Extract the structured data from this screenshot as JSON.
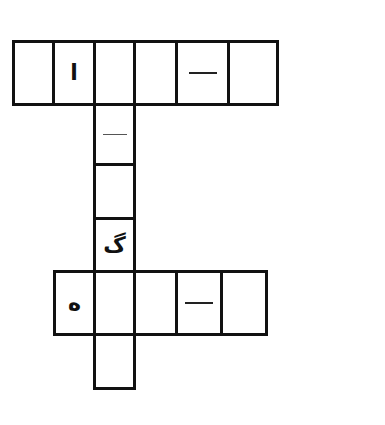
{
  "puzzle": {
    "type": "crossword-grid",
    "top_row": {
      "cells": [
        {
          "content": ""
        },
        {
          "content": "ا"
        },
        {
          "content": ""
        },
        {
          "content": ""
        },
        {
          "content": "—",
          "kind": "dash"
        },
        {
          "content": ""
        }
      ]
    },
    "vertical_column": {
      "cells": [
        {
          "content": "—",
          "kind": "dash"
        },
        {
          "content": ""
        },
        {
          "content": "گ"
        }
      ]
    },
    "bottom_row": {
      "cells": [
        {
          "content": "ه"
        },
        {
          "content": ""
        },
        {
          "content": ""
        },
        {
          "content": "—",
          "kind": "dash"
        },
        {
          "content": ""
        }
      ]
    },
    "tail_cell": {
      "content": ""
    },
    "colors": {
      "border": "#111111",
      "background": "#ffffff"
    }
  }
}
